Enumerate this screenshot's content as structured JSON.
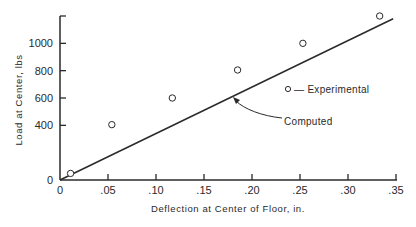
{
  "chart_data": {
    "type": "scatter",
    "title": "",
    "xlabel": "Deflection at Center of Floor, in.",
    "ylabel": "Load at Center, lbs",
    "xlim": [
      0,
      0.35
    ],
    "ylim": [
      0,
      1200
    ],
    "x_ticks": [
      0,
      0.05,
      0.1,
      0.15,
      0.2,
      0.25,
      0.3,
      0.35
    ],
    "x_tick_labels": [
      "0",
      ".05",
      ".10",
      ".15",
      ".20",
      ".25",
      ".30",
      ".35"
    ],
    "y_ticks": [
      0,
      400,
      600,
      800,
      1000,
      1200
    ],
    "y_tick_labels": [
      "0",
      "400",
      "600",
      "800",
      "1000",
      ""
    ],
    "grid": false,
    "series": [
      {
        "name": "Experimental",
        "type": "scatter",
        "marker": "open-circle",
        "x": [
          0.011,
          0.054,
          0.117,
          0.185,
          0.253,
          0.333
        ],
        "y": [
          48,
          405,
          600,
          805,
          1000,
          1200
        ]
      },
      {
        "name": "Computed",
        "type": "line",
        "x": [
          0,
          0.347
        ],
        "y": [
          0,
          1180
        ]
      }
    ],
    "annotations": [
      {
        "text": "Computed",
        "arrow_to": {
          "x": 0.181,
          "y": 490
        }
      }
    ],
    "legend": {
      "entries": [
        "o — Experimental"
      ],
      "position": "inside-right"
    }
  },
  "labels": {
    "xlabel": "Deflection at Center of Floor, in.",
    "ylabel": "Load at Center, lbs",
    "legend_experimental": "— Experimental",
    "annotation_computed": "Computed"
  },
  "colors": {
    "ink": "#2a2a2a",
    "background": "#ffffff"
  }
}
